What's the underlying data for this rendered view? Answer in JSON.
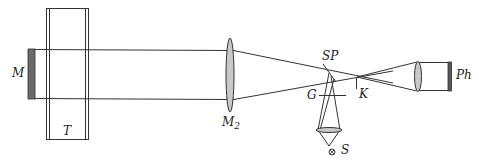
{
  "diagram": {
    "type": "optical-setup",
    "labels": {
      "M": "M",
      "T": "T",
      "M2_main": "M",
      "M2_sub": "2",
      "SP": "SP",
      "G": "G",
      "K": "K",
      "S": "S",
      "Ph": "Ph"
    },
    "colors": {
      "line": "#333333",
      "lens_fill": "#c8c8c8",
      "plate_fill": "#6a6a6a",
      "detector_fill": "#555555"
    }
  }
}
